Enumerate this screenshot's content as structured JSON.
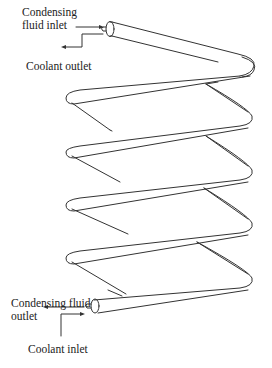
{
  "diagram": {
    "type": "helical coil heat exchanger",
    "labels": {
      "condensing_fluid_inlet_line1": "Condensing",
      "condensing_fluid_inlet_line2": "fluid inlet",
      "coolant_outlet": "Coolant outlet",
      "condensing_fluid_outlet_line1": "Condensing fluid",
      "condensing_fluid_outlet_line2": "outlet",
      "coolant_inlet": "Coolant inlet"
    },
    "turns": 5,
    "colors": {
      "stroke": "#333333",
      "background": "#ffffff"
    }
  }
}
